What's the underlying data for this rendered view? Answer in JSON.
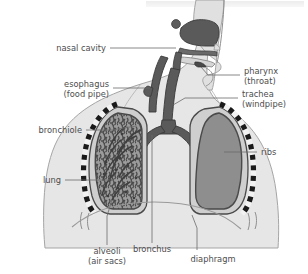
{
  "figure": {
    "top_band_color": "#efefef",
    "background_color": "#ffffff",
    "label_color": "#4d4d4d",
    "leader_color": "#6b6b6b",
    "body_fill": "#e3e3e3",
    "body_stroke": "#9a9a9a",
    "head_fill": "#e0e0e0",
    "airway_fill": "#5a5a5a",
    "airway_stroke": "#3a3a3a",
    "lung_cavity_fill": "#cfcfcf",
    "lung_right_fill": "#8e8e8e",
    "lung_left_fill": "#9b9b9b",
    "lung_stroke": "#4a4a4a",
    "rib_dark": "#1a1a1a",
    "rib_light": "#f2f2f2",
    "alveoli_texture": "#4f4f4f"
  },
  "labels": {
    "nasal_cavity": {
      "line1": "nasal cavity",
      "line2": ""
    },
    "esophagus": {
      "line1": "esophagus",
      "line2": "(food pipe)"
    },
    "bronchiole": {
      "line1": "bronchiole",
      "line2": ""
    },
    "lung": {
      "line1": "lung",
      "line2": ""
    },
    "pharynx": {
      "line1": "pharynx",
      "line2": "(throat)"
    },
    "trachea": {
      "line1": "trachea",
      "line2": "(windpipe)"
    },
    "ribs": {
      "line1": "ribs",
      "line2": ""
    },
    "alveoli": {
      "line1": "alveoli",
      "line2": "(air sacs)"
    },
    "bronchus": {
      "line1": "bronchus",
      "line2": ""
    },
    "diaphragm": {
      "line1": "diaphragm",
      "line2": ""
    }
  }
}
